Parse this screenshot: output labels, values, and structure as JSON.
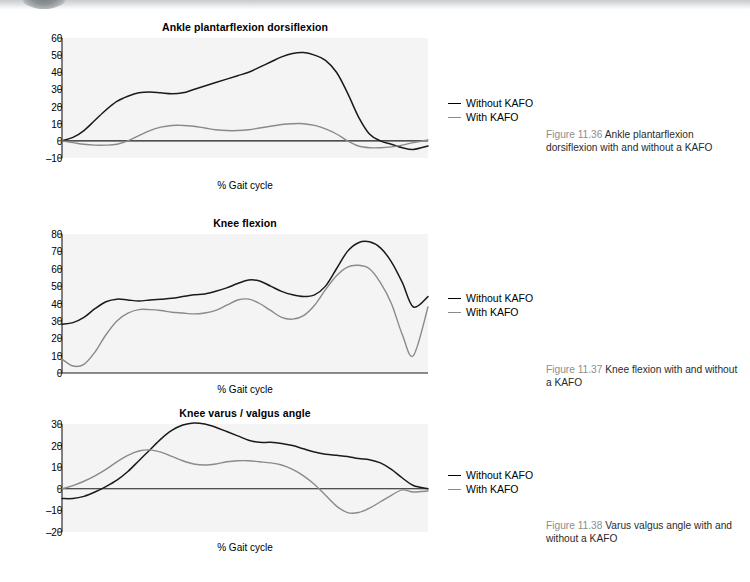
{
  "page": {
    "background_color": "#ffffff",
    "plot_background_color": "#f4f4f4",
    "series_colors": {
      "without_kafo": "#1a1a1a",
      "with_kafo": "#8a8a8a"
    }
  },
  "legend": {
    "without_label": "Without KAFO",
    "with_label": "With KAFO"
  },
  "figures": [
    {
      "caption_number": "Figure 11.36",
      "caption_text": "Ankle plantarflexion dorsiflexion with and without a KAFO"
    },
    {
      "caption_number": "Figure 11.37",
      "caption_text": "Knee flexion with and without a KAFO"
    },
    {
      "caption_number": "Figure 11.38",
      "caption_text": "Varus valgus angle with and without a KAFO"
    }
  ],
  "chart_data": [
    {
      "type": "line",
      "title": "Ankle plantarflexion dorsiflexion",
      "xlabel": "% Gait cycle",
      "ylabel": "",
      "grid": false,
      "legend_position": "right",
      "ylim": [
        -10,
        60
      ],
      "yticks": [
        60,
        50,
        40,
        30,
        20,
        10,
        0,
        -10
      ],
      "xlim": [
        0,
        100
      ],
      "x": [
        0,
        3,
        6,
        9,
        12,
        15,
        18,
        21,
        24,
        27,
        30,
        33,
        36,
        39,
        42,
        45,
        48,
        51,
        54,
        57,
        60,
        63,
        66,
        69,
        72,
        75,
        78,
        81,
        84,
        87,
        90,
        93,
        96,
        100
      ],
      "series": [
        {
          "name": "Without KAFO",
          "color": "#1a1a1a",
          "values": [
            0,
            2,
            6,
            12,
            18,
            23,
            26,
            28,
            28.5,
            28,
            27.5,
            28,
            30,
            32,
            34,
            36,
            38,
            40,
            43,
            46,
            49,
            51,
            51.5,
            50,
            47,
            40,
            28,
            14,
            4,
            0,
            -2,
            -4,
            -5,
            -3,
            0
          ]
        },
        {
          "name": "With KAFO",
          "color": "#8a8a8a",
          "values": [
            0,
            -1,
            -2,
            -2.5,
            -2.5,
            -2,
            0,
            3,
            6,
            8,
            9,
            9,
            8.5,
            7.5,
            6.5,
            6,
            6,
            6.5,
            7.5,
            8.5,
            9.5,
            10,
            10,
            9,
            7,
            4,
            0,
            -3,
            -4,
            -4,
            -3.5,
            -2.5,
            -1,
            0.5,
            0
          ]
        }
      ]
    },
    {
      "type": "line",
      "title": "Knee flexion",
      "xlabel": "% Gait cycle",
      "ylabel": "",
      "grid": false,
      "legend_position": "right",
      "ylim": [
        0,
        80
      ],
      "yticks": [
        80,
        70,
        60,
        50,
        40,
        30,
        20,
        10,
        0
      ],
      "xlim": [
        0,
        100
      ],
      "x": [
        0,
        3,
        6,
        9,
        12,
        15,
        18,
        21,
        24,
        27,
        30,
        33,
        36,
        39,
        42,
        45,
        48,
        51,
        54,
        57,
        60,
        63,
        66,
        69,
        72,
        75,
        78,
        81,
        84,
        87,
        90,
        93,
        96,
        100
      ],
      "series": [
        {
          "name": "Without KAFO",
          "color": "#1a1a1a",
          "values": [
            28,
            29,
            32,
            37,
            41,
            42.5,
            42,
            41.5,
            42,
            42.5,
            43,
            44,
            45,
            45.5,
            47,
            49,
            51.5,
            53.5,
            53,
            50,
            47,
            45,
            44,
            45,
            50,
            60,
            70,
            75,
            75.5,
            72,
            64,
            52,
            38,
            44
          ]
        },
        {
          "name": "With KAFO",
          "color": "#8a8a8a",
          "values": [
            8,
            4,
            5,
            12,
            22,
            30,
            34.5,
            36.5,
            36.5,
            36,
            35,
            34.5,
            34,
            34.5,
            36,
            39,
            42,
            42.5,
            40,
            36,
            32,
            31,
            33,
            39,
            48,
            56,
            61,
            62,
            60,
            52,
            40,
            22,
            10,
            38
          ]
        }
      ]
    },
    {
      "type": "line",
      "title": "Knee varus / valgus angle",
      "xlabel": "% Gait cycle",
      "ylabel": "",
      "grid": false,
      "legend_position": "right",
      "ylim": [
        -20,
        30
      ],
      "yticks": [
        30,
        20,
        10,
        0,
        -10,
        -20
      ],
      "xlim": [
        0,
        100
      ],
      "x": [
        0,
        3,
        6,
        9,
        12,
        15,
        18,
        21,
        24,
        27,
        30,
        33,
        36,
        39,
        42,
        45,
        48,
        51,
        54,
        57,
        60,
        63,
        66,
        69,
        72,
        75,
        78,
        81,
        84,
        87,
        90,
        93,
        96,
        100
      ],
      "series": [
        {
          "name": "Without KAFO",
          "color": "#1a1a1a",
          "values": [
            -4.5,
            -4.5,
            -3.5,
            -1.5,
            1,
            4,
            8,
            13,
            18,
            23,
            27,
            29.5,
            30.5,
            30,
            28.5,
            26.5,
            24.5,
            22.5,
            21.5,
            21.5,
            21,
            20,
            18.5,
            17,
            16,
            15.5,
            15,
            14,
            13.5,
            12,
            9,
            5,
            1.5,
            0
          ]
        },
        {
          "name": "With KAFO",
          "color": "#8a8a8a",
          "values": [
            0,
            1.5,
            3.5,
            6,
            9,
            12.5,
            15.5,
            17.5,
            18,
            17,
            15,
            13,
            11.5,
            11,
            11.5,
            12.5,
            13,
            13,
            12.5,
            12,
            11,
            9,
            6,
            2,
            -3,
            -8,
            -11,
            -11,
            -9,
            -6,
            -3,
            -0.5,
            -1.5,
            -1
          ]
        }
      ]
    }
  ]
}
